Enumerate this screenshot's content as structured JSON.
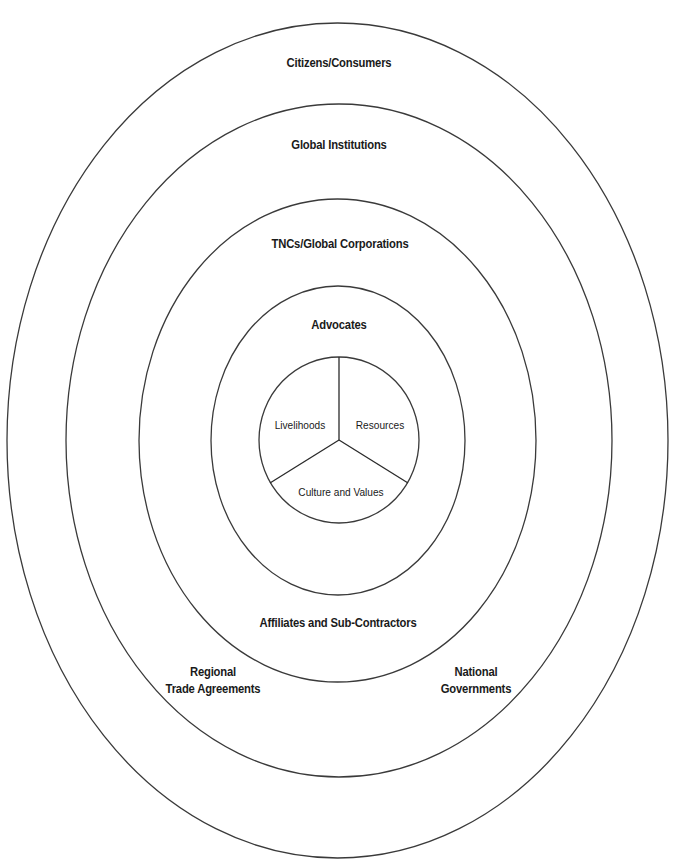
{
  "diagram": {
    "type": "concentric-ellipses",
    "stroke_color": "#3a3a3a",
    "background": "#ffffff",
    "rings": [
      {
        "id": "outer",
        "label": "Citizens/Consumers",
        "cx": 337.5,
        "cy": 440.5,
        "rx": 330.5,
        "ry": 417.5
      },
      {
        "id": "second",
        "label": "Global Institutions",
        "cx": 339,
        "cy": 440.5,
        "rx": 273,
        "ry": 336.5
      },
      {
        "id": "third",
        "label": "TNCs/Global Corporations",
        "cx": 337.5,
        "cy": 440.5,
        "rx": 198.5,
        "ry": 241.5
      },
      {
        "id": "fourth",
        "label": "Advocates",
        "cx": 338,
        "cy": 440.5,
        "rx": 127,
        "ry": 154.5
      },
      {
        "id": "core",
        "label": "",
        "cx": 339,
        "cy": 440,
        "rx": 80,
        "ry": 83
      }
    ],
    "ring_labels": {
      "citizens": "Citizens/Consumers",
      "global_institutions": "Global Institutions",
      "tncs": "TNCs/Global Corporations",
      "advocates": "Advocates",
      "affiliates": "Affiliates and Sub-Contractors",
      "regional_line1": "Regional",
      "regional_line2": "Trade Agreements",
      "national_line1": "National",
      "national_line2": "Governments"
    },
    "core_segments": {
      "livelihoods": "Livelihoods",
      "resources": "Resources",
      "culture": "Culture and Values"
    }
  }
}
